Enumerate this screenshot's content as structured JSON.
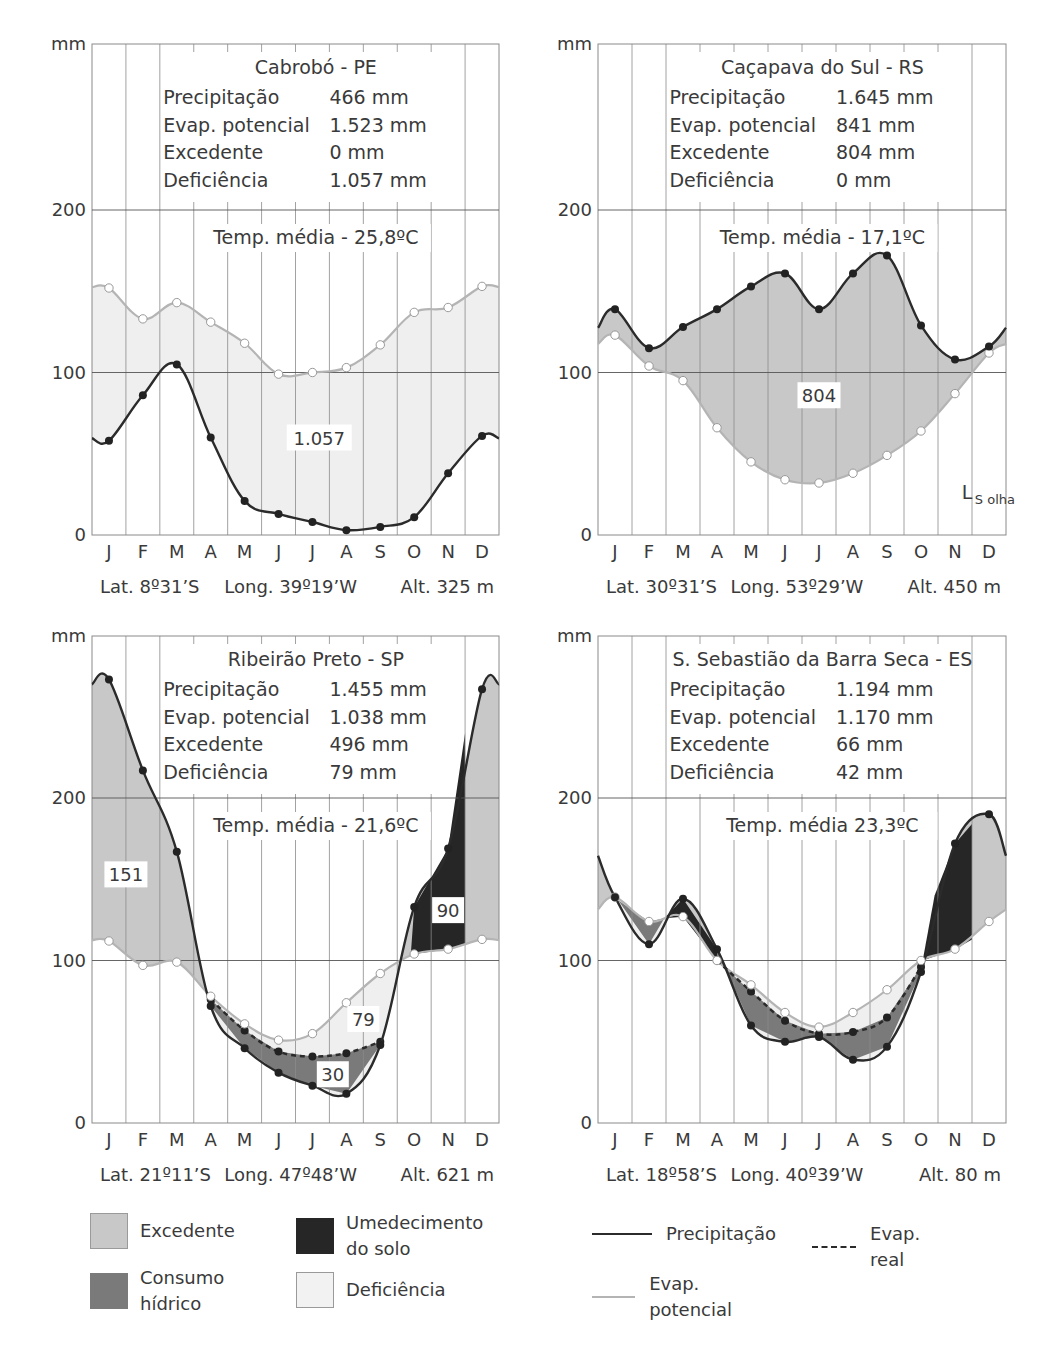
{
  "months": [
    "J",
    "F",
    "M",
    "A",
    "M",
    "J",
    "J",
    "A",
    "S",
    "O",
    "N",
    "D"
  ],
  "y_unit": "mm",
  "y_ticks": [
    0,
    100,
    200
  ],
  "colors": {
    "precipitation": "#2b2b2b",
    "evap_potential": "#b4b4b4",
    "evap_real": "#2b2b2b",
    "excedente": "#c8c8c8",
    "consumo_hidrico": "#7a7a7a",
    "umedecimento_do_solo": "#262626",
    "deficiencia": "#efefef",
    "grid": "#8a8a8a"
  },
  "legend": {
    "areas": [
      {
        "key": "excedente",
        "label": "Excedente"
      },
      {
        "key": "umedecimento_do_solo",
        "label": "Umedecimento do solo"
      },
      {
        "key": "consumo_hidrico",
        "label": "Consumo hídrico"
      },
      {
        "key": "deficiencia",
        "label": "Deficiência"
      }
    ],
    "lines": [
      {
        "key": "precipitation",
        "label": "Precipitação",
        "style": "solid"
      },
      {
        "key": "evap_real",
        "label": "Evap. real",
        "style": "dashed"
      },
      {
        "key": "evap_potential",
        "label": "Evap. potencial",
        "style": "solid-light"
      }
    ]
  },
  "chart_data": [
    {
      "type": "line",
      "title": "Cabrobó - PE",
      "stats": [
        {
          "label": "Precipitação",
          "value": "466 mm"
        },
        {
          "label": "Evap. potencial",
          "value": "1.523 mm"
        },
        {
          "label": "Excedente",
          "value": "0 mm"
        },
        {
          "label": "Deficiência",
          "value": "1.057 mm"
        }
      ],
      "temp": "Temp. média - 25,8ºC",
      "footer": {
        "lat": "Lat. 8º31’S",
        "long": "Long. 39º19’W",
        "alt": "Alt. 325 m"
      },
      "categories": [
        "J",
        "F",
        "M",
        "A",
        "M",
        "J",
        "J",
        "A",
        "S",
        "O",
        "N",
        "D"
      ],
      "ylabel": "mm",
      "ylim": [
        0,
        300
      ],
      "grid": true,
      "series": [
        {
          "name": "Precipitação",
          "values": [
            58,
            86,
            105,
            60,
            21,
            13,
            8,
            3,
            5,
            11,
            38,
            61
          ]
        },
        {
          "name": "Evap. potencial",
          "values": [
            152,
            133,
            143,
            131,
            118,
            99,
            100,
            103,
            117,
            137,
            140,
            153
          ]
        }
      ],
      "annotations": [
        {
          "text": "1.057",
          "month_index": 6.2,
          "value": 60
        }
      ]
    },
    {
      "type": "line",
      "title": "Caçapava do Sul - RS",
      "stats": [
        {
          "label": "Precipitação",
          "value": "1.645 mm"
        },
        {
          "label": "Evap. potencial",
          "value": "841 mm"
        },
        {
          "label": "Excedente",
          "value": "804 mm"
        },
        {
          "label": "Deficiência",
          "value": "0 mm"
        }
      ],
      "temp": "Temp. média - 17,1ºC",
      "footer": {
        "lat": "Lat. 30º31’S",
        "long": "Long. 53º29’W",
        "alt": "Alt. 450 m"
      },
      "categories": [
        "J",
        "F",
        "M",
        "A",
        "M",
        "J",
        "J",
        "A",
        "S",
        "O",
        "N",
        "D"
      ],
      "ylabel": "mm",
      "ylim": [
        0,
        300
      ],
      "grid": true,
      "series": [
        {
          "name": "Precipitação",
          "values": [
            139,
            115,
            128,
            139,
            153,
            161,
            139,
            161,
            172,
            129,
            108,
            116
          ]
        },
        {
          "name": "Evap. potencial",
          "values": [
            123,
            104,
            95,
            66,
            45,
            34,
            32,
            38,
            49,
            64,
            87,
            112
          ]
        }
      ],
      "annotations": [
        {
          "text": "804",
          "month_index": 6.0,
          "value": 86
        },
        {
          "text": "L",
          "sub": "S olha",
          "month_index": 10.2,
          "value": 22
        }
      ]
    },
    {
      "type": "line",
      "title": "Ribeirão Preto - SP",
      "stats": [
        {
          "label": "Precipitação",
          "value": "1.455 mm"
        },
        {
          "label": "Evap. potencial",
          "value": "1.038 mm"
        },
        {
          "label": "Excedente",
          "value": "496 mm"
        },
        {
          "label": "Deficiência",
          "value": "79 mm"
        }
      ],
      "temp": "Temp. média - 21,6ºC",
      "footer": {
        "lat": "Lat. 21º11’S",
        "long": "Long. 47º48’W",
        "alt": "Alt. 621 m"
      },
      "categories": [
        "J",
        "F",
        "M",
        "A",
        "M",
        "J",
        "J",
        "A",
        "S",
        "O",
        "N",
        "D"
      ],
      "ylabel": "mm",
      "ylim": [
        0,
        300
      ],
      "grid": true,
      "series": [
        {
          "name": "Precipitação",
          "values": [
            273,
            217,
            167,
            72,
            46,
            31,
            23,
            18,
            48,
            133,
            169,
            267
          ]
        },
        {
          "name": "Evap. potencial",
          "values": [
            112,
            97,
            99,
            78,
            61,
            51,
            55,
            74,
            92,
            104,
            107,
            113
          ]
        },
        {
          "name": "Evap. real",
          "values": [
            null,
            null,
            null,
            76,
            57,
            44,
            41,
            43,
            50,
            null,
            null,
            null
          ]
        }
      ],
      "annotations": [
        {
          "text": "151",
          "month_index": 0.5,
          "value": 153
        },
        {
          "text": "90",
          "month_index": 10.0,
          "value": 131
        },
        {
          "text": "79",
          "month_index": 7.5,
          "value": 64
        },
        {
          "text": "30",
          "month_index": 6.6,
          "value": 30
        }
      ]
    },
    {
      "type": "line",
      "title": "S. Sebastião da Barra Seca - ES",
      "stats": [
        {
          "label": "Precipitação",
          "value": "1.194 mm"
        },
        {
          "label": "Evap. potencial",
          "value": "1.170 mm"
        },
        {
          "label": "Excedente",
          "value": "66 mm"
        },
        {
          "label": "Deficiência",
          "value": "42 mm"
        }
      ],
      "temp": "Temp. média 23,3ºC",
      "footer": {
        "lat": "Lat. 18º58’S",
        "long": "Long. 40º39’W",
        "alt": "Alt. 80 m"
      },
      "categories": [
        "J",
        "F",
        "M",
        "A",
        "M",
        "J",
        "J",
        "A",
        "S",
        "O",
        "N",
        "D"
      ],
      "ylabel": "mm",
      "ylim": [
        0,
        300
      ],
      "grid": true,
      "series": [
        {
          "name": "Precipitação",
          "values": [
            139,
            110,
            138,
            107,
            60,
            50,
            53,
            39,
            47,
            93,
            172,
            190
          ]
        },
        {
          "name": "Evap. potencial",
          "values": [
            139,
            124,
            127,
            100,
            85,
            68,
            59,
            68,
            82,
            100,
            107,
            124
          ]
        },
        {
          "name": "Evap. real",
          "values": [
            null,
            null,
            null,
            100,
            81,
            63,
            55,
            56,
            65,
            96,
            null,
            null
          ]
        }
      ],
      "annotations": []
    }
  ]
}
